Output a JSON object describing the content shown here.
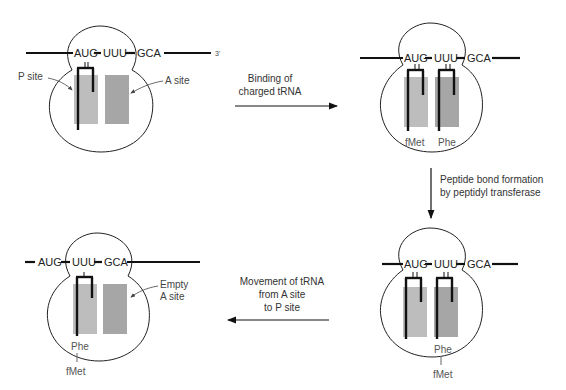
{
  "codons": [
    "AUG",
    "UUU",
    "GCA"
  ],
  "three_prime_label": "3'",
  "panels": {
    "initial": {
      "p_site_label": "P site",
      "a_site_label": "A site"
    },
    "bound": {
      "trna_labels": [
        "fMet",
        "Phe"
      ]
    },
    "peptide_bond": {
      "chain_top": "Phe",
      "chain_bottom": "fMet"
    },
    "translocated": {
      "empty_site_label_1": "Empty",
      "empty_site_label_2": "A site",
      "chain_top": "Phe",
      "chain_bottom": "fMet"
    }
  },
  "steps": {
    "binding": [
      "Binding of",
      "charged tRNA"
    ],
    "peptide": [
      "Peptide bond formation",
      "by peptidyl transferase"
    ],
    "movement": [
      "Movement of tRNA",
      "from A site",
      "to P site"
    ]
  }
}
